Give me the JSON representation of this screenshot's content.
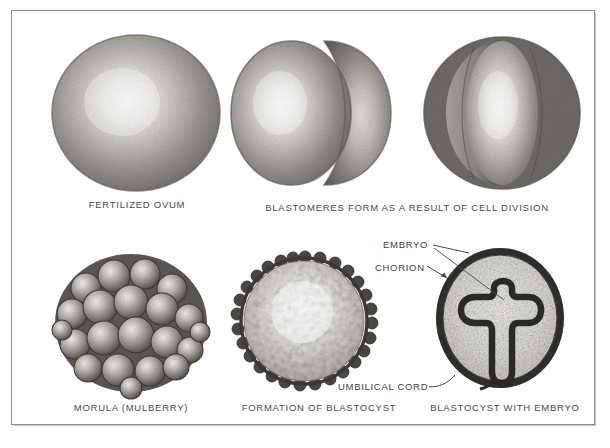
{
  "plate": {
    "title": "Stages of early human embryonic development",
    "background_color": "#fdfdfd",
    "frame_color": "#8d8d8d",
    "text_color": "#4a4a4a"
  },
  "figures": [
    {
      "id": "fertilized-ovum",
      "caption": "FERTILIZED OVUM",
      "row": 1,
      "column": 1,
      "shape": "single sphere with central highlight"
    },
    {
      "id": "two-cell-stage",
      "caption": "",
      "row": 1,
      "column": 2,
      "shape": "two blastomeres, large left lobe and smaller right lobe"
    },
    {
      "id": "four-cell-stage",
      "caption": "",
      "row": 1,
      "column": 3,
      "shape": "multiple blastomeres, bright central lobe with darker flanking lobes"
    },
    {
      "id": "morula",
      "caption": "MORULA (MULBERRY)",
      "row": 2,
      "column": 1,
      "shape": "cluster of many rounded cells"
    },
    {
      "id": "blastocyst-formation",
      "caption": "FORMATION OF BLASTOCYST",
      "row": 2,
      "column": 2,
      "shape": "sphere with beaded crenellated rim and mottled interior"
    },
    {
      "id": "blastocyst-with-embryo",
      "caption": "BLASTOCYST WITH EMBRYO",
      "row": 2,
      "column": 3,
      "shape": "oval sac with dark wall enclosing T-shaped embryo"
    }
  ],
  "captions": {
    "fertilized_ovum": "FERTILIZED OVUM",
    "blastomeres": "BLASTOMERES FORM AS A RESULT OF CELL DIVISION",
    "morula": "MORULA (MULBERRY)",
    "blastocyst_formation": "FORMATION OF BLASTOCYST",
    "blastocyst_with_embryo": "BLASTOCYST WITH EMBRYO"
  },
  "annotations": {
    "embryo": "EMBRYO",
    "chorion": "CHORION",
    "umbilical_cord": "UMBILICAL CORD"
  }
}
